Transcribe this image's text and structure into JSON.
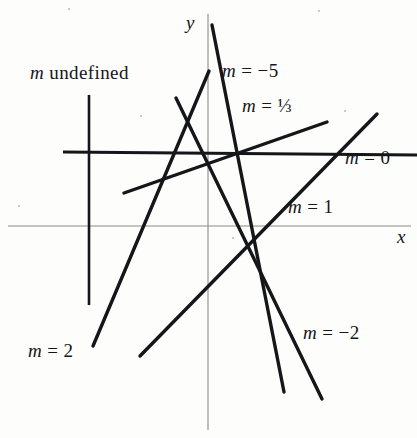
{
  "figure": {
    "background_color": "#fdfdfb",
    "ink_color": "#15161a",
    "axis_color": "#8a8a86",
    "width": 417,
    "height": 438
  },
  "axes": {
    "x_axis_label": "x",
    "y_axis_label": "y",
    "x_axis_y_px": 226,
    "y_axis_x_px": 208
  },
  "labels": {
    "m_undefined": "m undefined",
    "m_neg5": "m = −5",
    "m_third": "m = ⅓",
    "m_zero": "m = 0",
    "m_one": "m = 1",
    "m_neg2": "m = −2",
    "m_two": "m = 2"
  },
  "chart_data": {
    "type": "line",
    "xlabel": "x",
    "ylabel": "y",
    "grid": false,
    "legend": "inline-annotations",
    "origin_px": [
      208,
      226
    ],
    "series": [
      {
        "name": "m undefined",
        "slope": "undefined",
        "label": "m undefined",
        "label_pos_px": [
          30,
          62
        ],
        "p1_px": [
          89,
          95
        ],
        "p2_px": [
          89,
          305
        ],
        "stroke_width": 2.6
      },
      {
        "name": "m = 0",
        "slope": 0,
        "label": "m = 0",
        "label_pos_px": [
          345,
          147
        ],
        "p1_px": [
          63,
          152
        ],
        "p2_px": [
          417,
          155
        ],
        "stroke_width": 3.0
      },
      {
        "name": "m = 1/3",
        "slope": 0.3333,
        "label": "m = ⅓",
        "label_pos_px": [
          242,
          95
        ],
        "p1_px": [
          124,
          193
        ],
        "p2_px": [
          327,
          122
        ],
        "stroke_width": 3.4
      },
      {
        "name": "m = 1",
        "slope": 1,
        "label": "m = 1",
        "label_pos_px": [
          288,
          196
        ],
        "p1_px": [
          140,
          356
        ],
        "p2_px": [
          377,
          114
        ],
        "stroke_width": 3.4
      },
      {
        "name": "m = 2",
        "slope": 2,
        "label": "m = 2",
        "label_pos_px": [
          28,
          340
        ],
        "p1_px": [
          93,
          346
        ],
        "p2_px": [
          209,
          71
        ],
        "stroke_width": 3.4
      },
      {
        "name": "m = -2",
        "slope": -2,
        "label": "m = −2",
        "label_pos_px": [
          303,
          322
        ],
        "p1_px": [
          176,
          98
        ],
        "p2_px": [
          322,
          399
        ],
        "stroke_width": 3.4
      },
      {
        "name": "m = -5",
        "slope": -5,
        "label": "m = −5",
        "label_pos_px": [
          222,
          60
        ],
        "p1_px": [
          212,
          25
        ],
        "p2_px": [
          284,
          392
        ],
        "stroke_width": 3.4
      }
    ]
  }
}
